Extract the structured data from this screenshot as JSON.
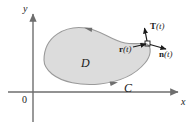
{
  "figure": {
    "background_color": "#ffffff",
    "region_fill_color": "#dcdcdc",
    "region_stroke_color": "#9a9a9a",
    "axis_color": "#6e6e6e",
    "ink_color": "#1a1a1a"
  },
  "axes": {
    "y_label": "y",
    "x_label": "x",
    "origin_label": "0",
    "x_axis": {
      "x1": 8,
      "y1": 92,
      "x2": 180,
      "y2": 92
    },
    "y_axis": {
      "x1": 33,
      "y1": 122,
      "x2": 33,
      "y2": 12
    }
  },
  "region": {
    "label": "D",
    "label_x": 81,
    "label_y": 57
  },
  "curve": {
    "label": "C",
    "label_x": 124,
    "label_y": 82,
    "orientation": "counterclockwise",
    "arrowhead_count": 2
  },
  "vectors": [
    {
      "name": "T",
      "arg": "(t)",
      "label": "T(t)",
      "description": "unit tangent vector",
      "direction": "up-left"
    },
    {
      "name": "r",
      "arg": "(t)",
      "label": "r(t)",
      "description": "position vector",
      "direction": "toward-curve-point"
    },
    {
      "name": "n",
      "arg": "(t)",
      "label": "n(t)",
      "description": "outward unit normal vector",
      "direction": "right"
    }
  ]
}
